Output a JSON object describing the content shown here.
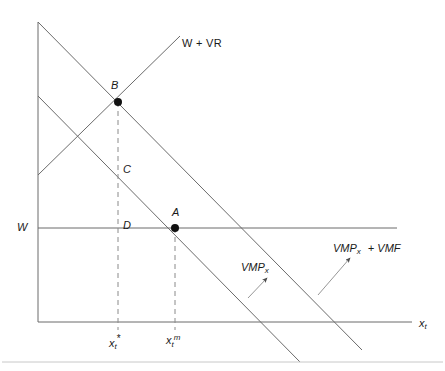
{
  "figure": {
    "background": "#ffffff",
    "line_color": "#6b6b6b",
    "text_color": "#1a1a1a",
    "width": 445,
    "height": 371
  },
  "axes": {
    "y_axis_label": "W",
    "x_axis_label_base": "x",
    "x_axis_label_sub": "t",
    "origin_x": 38,
    "origin_y": 322,
    "y_top": 22,
    "x_right": 412
  },
  "curves": [
    {
      "id": "vmp-plus-vmf",
      "label_base": "VMP",
      "label_sub": "x",
      "label_tail": "+ VMF",
      "label_full": "VMPx + VMF",
      "description": "upper downward-sloping line"
    },
    {
      "id": "vmp",
      "label_base": "VMP",
      "label_sub": "x",
      "label_full": "VMPx",
      "description": "lower downward-sloping line"
    },
    {
      "id": "w-plus-vr",
      "label_full": "W + VR",
      "description": "upward-sloping line"
    },
    {
      "id": "wage-line",
      "label_full": "W",
      "description": "horizontal wage line"
    }
  ],
  "points": [
    {
      "id": "point-b",
      "label": "B",
      "filled": true,
      "x": 118,
      "y": 102
    },
    {
      "id": "point-c",
      "label": "C",
      "filled": false,
      "x": 118,
      "y": 170
    },
    {
      "id": "point-d",
      "label": "D",
      "filled": false,
      "x": 118,
      "y": 228
    },
    {
      "id": "point-a",
      "label": "A",
      "filled": true,
      "x": 175,
      "y": 228
    }
  ],
  "ticks": [
    {
      "id": "tick-x-star",
      "base": "x",
      "sub": "t",
      "sup": "*",
      "full": "xt*",
      "x": 118
    },
    {
      "id": "tick-x-m",
      "base": "x",
      "sub": "t",
      "sup": "m",
      "full": "xtm",
      "x": 175
    }
  ],
  "annotations": [
    {
      "id": "vmp-leader",
      "target": "vmp",
      "description": "arrow pointing to lower line"
    },
    {
      "id": "vmp-vmf-leader",
      "target": "vmp-plus-vmf",
      "description": "arrow pointing to upper line"
    }
  ]
}
